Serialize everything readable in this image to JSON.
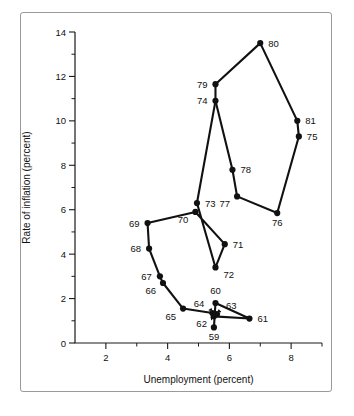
{
  "figure": {
    "background_color": "#ffffff",
    "border_color": "#9a9a9a",
    "ink_color": "#111111"
  },
  "chart_data": {
    "type": "scatter",
    "title": "",
    "subtitle": "",
    "xlabel": "Unemployment (percent)",
    "ylabel": "Rate of inflation (percent)",
    "xlim": [
      1,
      9
    ],
    "ylim": [
      0,
      14
    ],
    "xticks": [
      2,
      4,
      6,
      8
    ],
    "xtick_labels": [
      "2",
      "4",
      "6",
      "8"
    ],
    "x_minor_ticks": [
      1,
      3,
      5,
      7,
      9
    ],
    "yticks": [
      0,
      2,
      4,
      6,
      8,
      10,
      12,
      14
    ],
    "ytick_labels": [
      "0",
      "2",
      "4",
      "6",
      "8",
      "10",
      "12",
      "14"
    ],
    "y_minor_ticks": [
      1,
      3,
      5,
      7,
      9,
      11,
      13
    ],
    "grid": false,
    "legend": "none",
    "connected": true,
    "point_label_field": "label",
    "points": [
      {
        "label": "59",
        "x": 5.5,
        "y": 0.7,
        "label_pos": "below",
        "leader": false
      },
      {
        "label": "60",
        "x": 5.55,
        "y": 1.8,
        "label_pos": "above",
        "leader": false
      },
      {
        "label": "61",
        "x": 6.65,
        "y": 1.1,
        "label_pos": "right",
        "leader": false
      },
      {
        "label": "62",
        "x": 5.5,
        "y": 1.2,
        "label_pos": "below-left",
        "leader": true
      },
      {
        "label": "63",
        "x": 5.6,
        "y": 1.3,
        "label_pos": "upper-right",
        "leader": true
      },
      {
        "label": "64",
        "x": 5.45,
        "y": 1.35,
        "label_pos": "upper-left",
        "leader": true
      },
      {
        "label": "65",
        "x": 4.5,
        "y": 1.55,
        "label_pos": "below-left",
        "leader": false
      },
      {
        "label": "66",
        "x": 3.85,
        "y": 2.7,
        "label_pos": "below-left",
        "leader": false
      },
      {
        "label": "67",
        "x": 3.75,
        "y": 3.0,
        "label_pos": "left",
        "leader": false
      },
      {
        "label": "68",
        "x": 3.4,
        "y": 4.25,
        "label_pos": "left",
        "leader": false
      },
      {
        "label": "69",
        "x": 3.35,
        "y": 5.4,
        "label_pos": "left",
        "leader": false
      },
      {
        "label": "70",
        "x": 4.9,
        "y": 5.9,
        "label_pos": "below-left",
        "leader": false
      },
      {
        "label": "71",
        "x": 5.85,
        "y": 4.45,
        "label_pos": "right",
        "leader": false
      },
      {
        "label": "72",
        "x": 5.55,
        "y": 3.4,
        "label_pos": "below-right",
        "leader": false
      },
      {
        "label": "73",
        "x": 4.95,
        "y": 6.3,
        "label_pos": "right",
        "leader": false
      },
      {
        "label": "74",
        "x": 5.55,
        "y": 10.9,
        "label_pos": "left",
        "leader": false
      },
      {
        "label": "75",
        "x": 8.25,
        "y": 9.3,
        "label_pos": "right",
        "leader": false
      },
      {
        "label": "76",
        "x": 7.55,
        "y": 5.85,
        "label_pos": "below",
        "leader": false
      },
      {
        "label": "77",
        "x": 6.25,
        "y": 6.6,
        "label_pos": "below-left",
        "leader": false
      },
      {
        "label": "78",
        "x": 6.1,
        "y": 7.8,
        "label_pos": "right",
        "leader": false
      },
      {
        "label": "79",
        "x": 5.55,
        "y": 11.65,
        "label_pos": "left",
        "leader": false
      },
      {
        "label": "80",
        "x": 7.0,
        "y": 13.5,
        "label_pos": "right",
        "leader": false
      },
      {
        "label": "81",
        "x": 8.2,
        "y": 10.0,
        "label_pos": "right",
        "leader": false
      }
    ],
    "paths": [
      [
        "59",
        "60",
        "61",
        "62",
        "63",
        "64",
        "65",
        "66",
        "67",
        "68",
        "69",
        "70",
        "71",
        "72",
        "73",
        "74"
      ],
      [
        "74",
        "78",
        "77",
        "76",
        "75",
        "81"
      ],
      [
        "74",
        "79",
        "80",
        "81"
      ]
    ]
  }
}
